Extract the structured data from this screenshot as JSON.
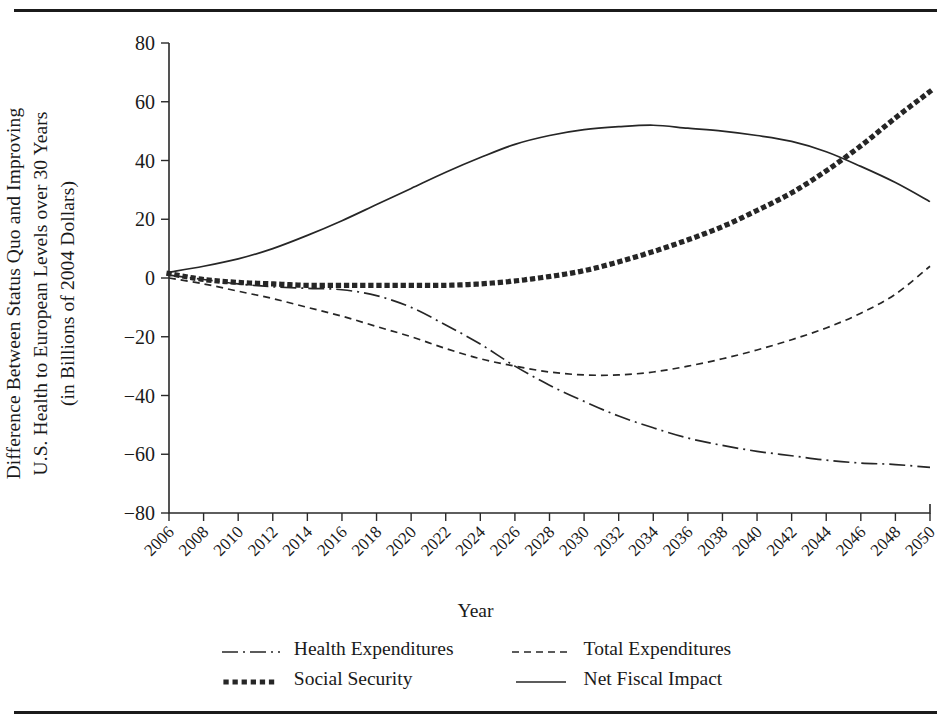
{
  "figure": {
    "ylabel_lines": [
      "Difference Between Status Quo and Improving",
      "U.S. Health to European Levels over 30 Years",
      "(in Billions of 2004 Dollars)"
    ],
    "xlabel": "Year"
  },
  "legend": {
    "items": [
      {
        "label": "Health Expenditures",
        "style": "dash-dot",
        "icon": "dash-dot-line-icon"
      },
      {
        "label": "Total Expenditures",
        "style": "dashed",
        "icon": "dashed-line-icon"
      },
      {
        "label": "Social Security",
        "style": "dotted-thick",
        "icon": "dotted-line-icon"
      },
      {
        "label": "Net Fiscal Impact",
        "style": "solid",
        "icon": "solid-line-icon"
      }
    ]
  },
  "chart_data": {
    "type": "line",
    "title": "",
    "xlabel": "Year",
    "ylabel": "Difference Between Status Quo and Improving U.S. Health to European Levels over 30 Years (in Billions of 2004 Dollars)",
    "x": [
      2006,
      2008,
      2010,
      2012,
      2014,
      2016,
      2018,
      2020,
      2022,
      2024,
      2026,
      2028,
      2030,
      2032,
      2034,
      2036,
      2038,
      2040,
      2042,
      2044,
      2046,
      2048,
      2050
    ],
    "xlim": [
      2006,
      2050
    ],
    "ylim": [
      -80,
      80
    ],
    "yticks": [
      80,
      60,
      40,
      20,
      0,
      -20,
      -40,
      -60,
      -80
    ],
    "xticks": [
      "2006",
      "2008",
      "2010",
      "2012",
      "2014",
      "2016",
      "2018",
      "2020",
      "2022",
      "2024",
      "2026",
      "2028",
      "2030",
      "2032",
      "2034",
      "2036",
      "2038",
      "2040",
      "2042",
      "2044",
      "2046",
      "2048",
      "2050"
    ],
    "grid": false,
    "legend_position": "bottom",
    "series": [
      {
        "name": "Health Expenditures",
        "style": "dash-dot",
        "values": [
          1.0,
          -0.5,
          -2.0,
          -3.0,
          -3.5,
          -4.0,
          -6.0,
          -10.0,
          -16.0,
          -22.5,
          -30.0,
          -36.5,
          -42.0,
          -47.0,
          -51.0,
          -54.5,
          -57.0,
          -59.0,
          -60.5,
          -62.0,
          -63.0,
          -63.5,
          -64.5
        ]
      },
      {
        "name": "Total Expenditures",
        "style": "dashed",
        "values": [
          0.0,
          -2.0,
          -4.5,
          -7.0,
          -10.0,
          -13.0,
          -16.5,
          -20.0,
          -24.0,
          -27.5,
          -30.0,
          -32.0,
          -33.0,
          -33.0,
          -32.0,
          -30.0,
          -27.5,
          -24.5,
          -21.0,
          -17.0,
          -12.0,
          -5.5,
          4.0
        ]
      },
      {
        "name": "Social Security",
        "style": "dotted-thick",
        "values": [
          1.5,
          -0.5,
          -1.5,
          -2.0,
          -2.5,
          -2.5,
          -2.5,
          -2.5,
          -2.5,
          -2.0,
          -1.0,
          0.5,
          2.5,
          5.5,
          9.0,
          13.0,
          17.5,
          23.0,
          29.0,
          36.5,
          45.0,
          54.5,
          63.5
        ]
      },
      {
        "name": "Net Fiscal Impact",
        "style": "solid",
        "values": [
          2.0,
          4.0,
          6.5,
          10.0,
          14.5,
          19.5,
          25.0,
          30.5,
          36.0,
          41.0,
          45.5,
          48.5,
          50.5,
          51.5,
          52.0,
          51.0,
          50.0,
          48.5,
          46.5,
          43.0,
          38.0,
          32.5,
          26.0
        ]
      }
    ]
  }
}
